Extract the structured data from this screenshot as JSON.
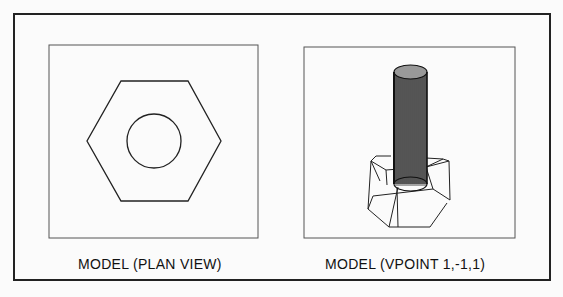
{
  "viewports": [
    {
      "id": "plan",
      "caption": "MODEL (PLAN VIEW)"
    },
    {
      "id": "vpoint",
      "caption": "MODEL (VPOINT 1,-1,1)"
    }
  ]
}
